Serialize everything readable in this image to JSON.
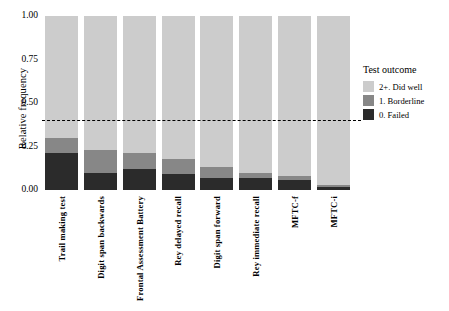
{
  "chart_data": {
    "type": "bar",
    "title": "",
    "subtitle": "",
    "xlabel": "",
    "ylabel": "Relative frequency",
    "ylim": [
      0,
      1
    ],
    "ytick_labels": [
      "0.00",
      "0.25",
      "0.50",
      "0.75",
      "1.00"
    ],
    "ytick_values": [
      0,
      0.25,
      0.5,
      0.75,
      1
    ],
    "grid": false,
    "stacked": true,
    "stack_order": [
      "0. Failed",
      "1. Borderline",
      "2+. Did well"
    ],
    "legend": {
      "title": "Test outcome",
      "position": "right",
      "entries": [
        {
          "label": "2+. Did well",
          "color": "#cccccc"
        },
        {
          "label": "1. Borderline",
          "color": "#878787"
        },
        {
          "label": "0. Failed",
          "color": "#2b2b2b"
        }
      ]
    },
    "annotations": [
      {
        "type": "hline",
        "value": 0.4,
        "style": "dashed",
        "color": "#000000"
      }
    ],
    "categories": [
      "Trail making test",
      "Digit span backwards",
      "Frontal Assessment Battery",
      "Rey delayed recall",
      "Digit span forward",
      "Rey immediate recall",
      "MFTC-f",
      "MFTC-i"
    ],
    "series": [
      {
        "name": "0. Failed",
        "color": "#2b2b2b",
        "values": [
          0.21,
          0.1,
          0.12,
          0.09,
          0.07,
          0.07,
          0.06,
          0.02
        ]
      },
      {
        "name": "1. Borderline",
        "color": "#878787",
        "values": [
          0.09,
          0.13,
          0.09,
          0.09,
          0.06,
          0.03,
          0.02,
          0.01
        ]
      },
      {
        "name": "2+. Did well",
        "color": "#cccccc",
        "values": [
          0.7,
          0.77,
          0.79,
          0.82,
          0.87,
          0.9,
          0.92,
          0.97
        ]
      }
    ]
  }
}
